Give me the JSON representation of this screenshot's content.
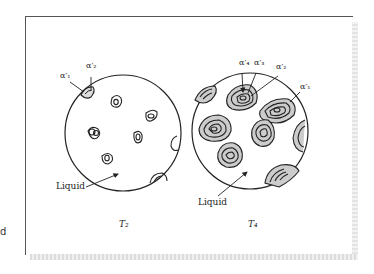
{
  "figure": {
    "left_panel": {
      "temperature_label": "T₂",
      "liquid_label": "Liquid",
      "phase_labels": [
        "α′₁",
        "α′₂"
      ]
    },
    "right_panel": {
      "temperature_label": "T₄",
      "liquid_label": "Liquid",
      "phase_labels": [
        "α′₄",
        "α′₃",
        "α′₂",
        "α′₁"
      ]
    },
    "side_fragment": "d"
  },
  "colors": {
    "line": "#222222",
    "grain_fill": "#c8c8c8",
    "background": "#ffffff"
  }
}
